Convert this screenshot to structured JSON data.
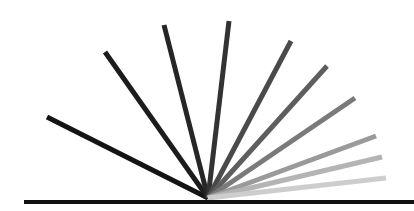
{
  "diagram": {
    "origin": {
      "x": 208,
      "y": 198
    },
    "baseline": {
      "x1": 24,
      "y1": 202,
      "x2": 414,
      "y2": 202,
      "color": "#111111",
      "width": 4
    },
    "rays": [
      {
        "x2": 47,
        "y2": 117,
        "color": "#141414"
      },
      {
        "x2": 105,
        "y2": 52,
        "color": "#1c1c1c"
      },
      {
        "x2": 164,
        "y2": 25,
        "color": "#262626"
      },
      {
        "x2": 229,
        "y2": 21,
        "color": "#333333"
      },
      {
        "x2": 291,
        "y2": 41,
        "color": "#4a4a4a"
      },
      {
        "x2": 327,
        "y2": 66,
        "color": "#5e5e5e"
      },
      {
        "x2": 355,
        "y2": 98,
        "color": "#7a7a7a"
      },
      {
        "x2": 376,
        "y2": 136,
        "color": "#9a9a9a"
      },
      {
        "x2": 382,
        "y2": 157,
        "color": "#b4b4b4"
      },
      {
        "x2": 386,
        "y2": 178,
        "color": "#cdcdcd"
      }
    ],
    "ray_width": 5
  }
}
